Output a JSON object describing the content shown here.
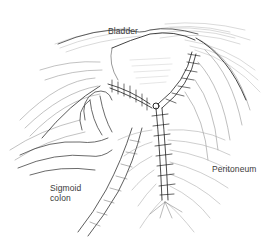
{
  "figure": {
    "style": "pen-and-ink line drawing",
    "colors": {
      "ink": "#2a2a2a",
      "hatch": "#9a9a9a",
      "label": "#3a3a3a",
      "background": "#ffffff"
    }
  },
  "labels": {
    "bladder": "Bladder",
    "peritoneum": "Peritoneum",
    "sigmoid_line1": "Sigmoid",
    "sigmoid_line2": "colon"
  }
}
